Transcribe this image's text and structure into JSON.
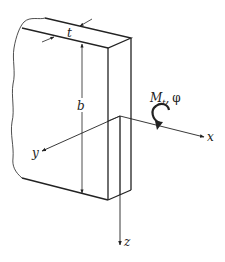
{
  "diagram": {
    "labels": {
      "thickness": "t",
      "width": "b",
      "moment": "M",
      "moment_subscript": "t",
      "moment_sep": ",",
      "angle": "φ",
      "axis_x": "x",
      "axis_y": "y",
      "axis_z": "z"
    },
    "colors": {
      "line": "#222222",
      "background": "#ffffff"
    }
  }
}
